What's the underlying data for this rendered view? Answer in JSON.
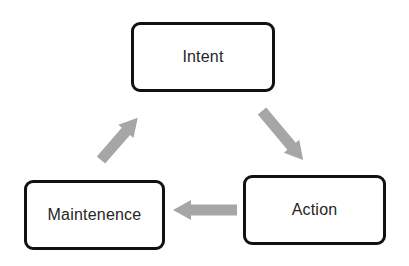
{
  "diagram": {
    "type": "cycle",
    "nodes": [
      {
        "id": "intent",
        "label": "Intent"
      },
      {
        "id": "action",
        "label": "Action"
      },
      {
        "id": "maintenence",
        "label": "Maintenence"
      }
    ],
    "edges": [
      {
        "from": "intent",
        "to": "action"
      },
      {
        "from": "action",
        "to": "maintenence"
      },
      {
        "from": "maintenence",
        "to": "intent"
      }
    ],
    "colors": {
      "node_border": "#111111",
      "node_fill": "#ffffff",
      "text": "#262626",
      "arrow": "#a6a6a6",
      "background": "#ffffff"
    }
  }
}
